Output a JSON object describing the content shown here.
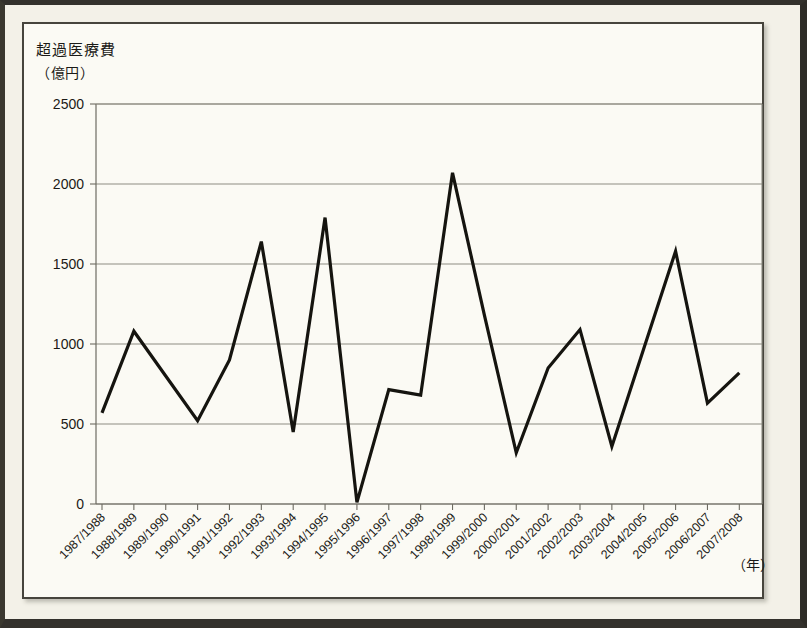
{
  "chart_data": {
    "type": "line",
    "title": "超過医療費",
    "ylabel": "（億円）",
    "xlabel": "（年）",
    "ylim": [
      0,
      2500
    ],
    "yticks": [
      0,
      500,
      1000,
      1500,
      2000,
      2500
    ],
    "grid": true,
    "legend": "none",
    "categories": [
      "1987/1988",
      "1988/1989",
      "1989/1990",
      "1990/1991",
      "1991/1992",
      "1992/1993",
      "1993/1994",
      "1994/1995",
      "1995/1996",
      "1996/1997",
      "1997/1998",
      "1998/1999",
      "1999/2000",
      "2000/2001",
      "2001/2002",
      "2002/2003",
      "2003/2004",
      "2004/2005",
      "2005/2006",
      "2006/2007",
      "2007/2008"
    ],
    "values": [
      570,
      1080,
      800,
      520,
      900,
      1640,
      450,
      1790,
      10,
      715,
      680,
      2070,
      1180,
      320,
      850,
      1090,
      360,
      970,
      1580,
      630,
      820
    ]
  }
}
